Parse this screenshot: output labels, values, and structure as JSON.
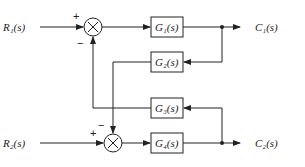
{
  "diagram": {
    "type": "block-diagram",
    "inputs": [
      {
        "id": "R1",
        "label": "R₁(s)"
      },
      {
        "id": "R2",
        "label": "R₂(s)"
      }
    ],
    "outputs": [
      {
        "id": "C1",
        "label": "C₁(s)"
      },
      {
        "id": "C2",
        "label": "C₂(s)"
      }
    ],
    "blocks": [
      {
        "id": "G1",
        "label": "G₁(s)"
      },
      {
        "id": "G2",
        "label": "G₂(s)"
      },
      {
        "id": "G3",
        "label": "G₃(s)"
      },
      {
        "id": "G4",
        "label": "G₄(s)"
      }
    ],
    "summing_junctions": [
      {
        "id": "S1",
        "symbol": "×",
        "signs": {
          "input": "+",
          "feedback": "−"
        }
      },
      {
        "id": "S2",
        "symbol": "×",
        "signs": {
          "input": "+",
          "feedback": "−"
        }
      }
    ],
    "connections": [
      "R1 -> S1(+)",
      "S1 -> G1",
      "G1 -> C1",
      "C1 -> G2",
      "G2 -> S2(-)",
      "R2 -> S2(+)",
      "S2 -> G4",
      "G4 -> C2",
      "C2 -> G3",
      "G3 -> S1(-)"
    ]
  }
}
